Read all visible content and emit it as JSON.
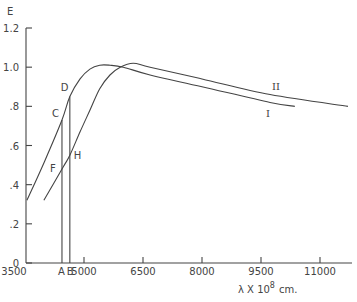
{
  "chart_data": {
    "type": "line",
    "title": "",
    "xlabel": "λ × 10^8 cm.",
    "xlabel_parts": {
      "main": "λ X 10",
      "sup": "8",
      "unit": "cm."
    },
    "ylabel": "E",
    "xlim": [
      3500,
      11600
    ],
    "ylim": [
      0,
      1.2
    ],
    "grid": false,
    "legend": "inline curve labels",
    "x_ticks": [
      3500,
      5000,
      6500,
      8000,
      9500,
      11000
    ],
    "x_tick_labels": [
      "3500",
      "5000",
      "6500",
      "8000",
      "9500",
      "11000"
    ],
    "y_ticks": [
      0,
      0.2,
      0.4,
      0.6,
      0.8,
      1.0,
      1.2
    ],
    "y_tick_labels": [
      "0",
      ".2",
      ".4",
      ".6",
      ".8",
      "1.0",
      "1.2"
    ],
    "series": [
      {
        "name": "I",
        "x": [
          3550,
          4000,
          4440,
          4640,
          4900,
          5150,
          5400,
          5660,
          6000,
          6680,
          8000,
          9730,
          10360
        ],
        "y": [
          0.32,
          0.52,
          0.73,
          0.85,
          0.94,
          0.99,
          1.01,
          1.01,
          1.0,
          0.96,
          0.9,
          0.82,
          0.8
        ]
      },
      {
        "name": "II",
        "x": [
          3980,
          4470,
          4640,
          4900,
          5150,
          5400,
          5660,
          5920,
          6250,
          6680,
          8000,
          9730,
          11710
        ],
        "y": [
          0.32,
          0.49,
          0.55,
          0.67,
          0.78,
          0.89,
          0.96,
          1.0,
          1.02,
          1.0,
          0.94,
          0.86,
          0.8
        ]
      }
    ],
    "vertical_lines": [
      {
        "label": "A",
        "x": 4440,
        "top_label": "C",
        "top_y": 0.73,
        "cross_label": "F",
        "cross_y": 0.49
      },
      {
        "label": "B",
        "x": 4640,
        "top_label": "D",
        "top_y": 0.85,
        "cross_label": "H",
        "cross_y": 0.55
      }
    ],
    "annotations": [
      "A",
      "B",
      "C",
      "D",
      "F",
      "H",
      "I",
      "II"
    ]
  }
}
